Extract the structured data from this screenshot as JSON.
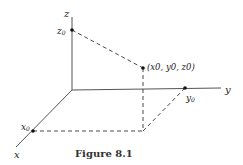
{
  "figure": {
    "caption": "Figure 8.1",
    "axes": {
      "x_label": "x",
      "y_label": "y",
      "z_label": "z"
    },
    "points": {
      "x0_label": "x",
      "x0_sub": "0",
      "y0_label": "y",
      "y0_sub": "0",
      "z0_label": "z",
      "z0_sub": "0",
      "point_label": "(x0, y0, z0)"
    },
    "colors": {
      "axis": "#555555",
      "dash": "#333333",
      "point": "#111111"
    }
  }
}
